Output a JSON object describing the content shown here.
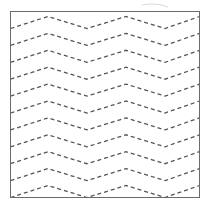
{
  "figure": {
    "name": "dashed-chevron-zigzag-pattern",
    "width": 211,
    "height": 210,
    "background_color": "#ffffff"
  },
  "frame": {
    "name": "square-border",
    "x": 10.5,
    "y": 11.5,
    "width": 189,
    "height": 185.5,
    "stroke_color": "#6a6a6a",
    "stroke_width": 1,
    "fill": "none"
  },
  "chart_data": {
    "type": "line",
    "title": "",
    "subtitle": "",
    "xlabel": "",
    "ylabel": "",
    "grid": false,
    "legend_position": "none",
    "xlim": [
      10.5,
      199.5
    ],
    "ylim": [
      11.5,
      197.0
    ],
    "x": [
      10.5,
      48.0,
      87.0,
      126.0,
      165.0,
      199.5
    ],
    "vertex_kinds": [
      "valley",
      "peak",
      "valley",
      "peak",
      "valley",
      "peak-partial"
    ],
    "amplitude": 12.0,
    "row_spacing": 16.9,
    "row_count": 11,
    "first_row_baseline": 28.5,
    "stroke_color": "#555555",
    "stroke_width": 1.3,
    "dash_pattern": "4 3",
    "series": [
      {
        "name": "chevron-row-1",
        "baseline": 28.5,
        "values": [
          28.5,
          16.5,
          28.5,
          16.5,
          28.5,
          16.5
        ]
      },
      {
        "name": "chevron-row-2",
        "baseline": 45.4,
        "values": [
          45.4,
          33.4,
          45.4,
          33.4,
          45.4,
          33.4
        ]
      },
      {
        "name": "chevron-row-3",
        "baseline": 62.3,
        "values": [
          62.3,
          50.3,
          62.3,
          50.3,
          62.3,
          50.3
        ]
      },
      {
        "name": "chevron-row-4",
        "baseline": 79.2,
        "values": [
          79.2,
          67.2,
          79.2,
          67.2,
          79.2,
          67.2
        ]
      },
      {
        "name": "chevron-row-5",
        "baseline": 96.1,
        "values": [
          96.1,
          84.1,
          96.1,
          84.1,
          96.1,
          84.1
        ]
      },
      {
        "name": "chevron-row-6",
        "baseline": 113.0,
        "values": [
          113.0,
          101.0,
          113.0,
          101.0,
          113.0,
          101.0
        ]
      },
      {
        "name": "chevron-row-7",
        "baseline": 129.9,
        "values": [
          129.9,
          117.9,
          129.9,
          117.9,
          129.9,
          117.9
        ]
      },
      {
        "name": "chevron-row-8",
        "baseline": 146.8,
        "values": [
          146.8,
          134.8,
          146.8,
          134.8,
          146.8,
          134.8
        ]
      },
      {
        "name": "chevron-row-9",
        "baseline": 163.7,
        "values": [
          163.7,
          151.7,
          163.7,
          151.7,
          163.7,
          151.7
        ]
      },
      {
        "name": "chevron-row-10",
        "baseline": 180.6,
        "values": [
          180.6,
          168.6,
          180.6,
          168.6,
          180.6,
          168.6
        ]
      },
      {
        "name": "chevron-row-11",
        "baseline": 197.5,
        "values": [
          197.5,
          185.5,
          197.5,
          185.5,
          197.5,
          185.5
        ]
      }
    ]
  },
  "artifact": {
    "name": "scan-smudge-mark",
    "d": "M 142 5 Q 155 2 168 7",
    "stroke_color": "#d9d9d9",
    "stroke_width": 1
  }
}
